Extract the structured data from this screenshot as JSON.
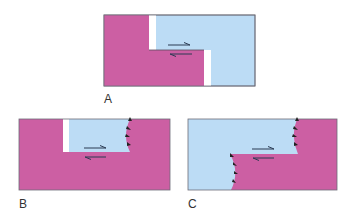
{
  "colors": {
    "pink": "#cc5fa3",
    "blue": "#bcdcf5",
    "outline": "#6d6d78",
    "arrow": "#2a3a52"
  },
  "panels": [
    {
      "label": "A",
      "description": "offset blocks with open gaps along a transform step"
    },
    {
      "label": "B",
      "description": "blue block inset in pink with curved thrust front"
    },
    {
      "label": "C",
      "description": "blue and pink blocks offset along step with two curved thrust fronts"
    }
  ]
}
